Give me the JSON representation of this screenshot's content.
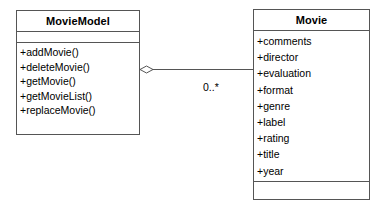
{
  "diagram": {
    "type": "uml-class-diagram",
    "classes": [
      {
        "id": "movie-model",
        "name": "MovieModel",
        "attributes": [],
        "operations": [
          "+addMovie()",
          "+deleteMovie()",
          "+getMovie()",
          "+getMovieList()",
          "+replaceMovie()"
        ]
      },
      {
        "id": "movie",
        "name": "Movie",
        "attributes": [
          "+comments",
          "+director",
          "+evaluation",
          "+format",
          "+genre",
          "+label",
          "+rating",
          "+title",
          "+year"
        ],
        "operations": []
      }
    ],
    "relationship": {
      "kind": "aggregation",
      "source": "MovieModel",
      "target": "Movie",
      "source_decoration": "hollow-diamond",
      "target_multiplicity": "0..*"
    },
    "colors": {
      "background": "#ffffff",
      "stroke": "#555555",
      "text": "#000000"
    }
  }
}
